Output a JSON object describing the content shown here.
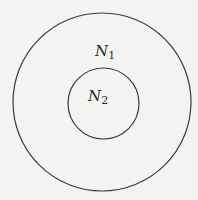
{
  "diagram": {
    "type": "nested-sets",
    "sets": [
      {
        "id": "outer",
        "label": "N",
        "subscript": "1"
      },
      {
        "id": "inner",
        "label": "N",
        "subscript": "2"
      }
    ],
    "relation": "N2 is contained within N1"
  }
}
